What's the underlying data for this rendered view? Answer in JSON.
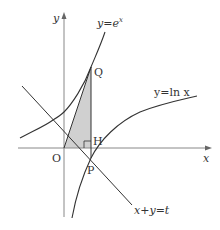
{
  "figure": {
    "colors": {
      "curve": "#333333",
      "axis": "#888888",
      "shade": "#d0d0d0",
      "background": "#ffffff"
    },
    "axes": {
      "x_label": "x",
      "y_label": "y"
    },
    "curves": {
      "exp_label": "y=e",
      "exp_superscript": "x",
      "ln_label": "y=ln x",
      "line_label": "x+y=t"
    },
    "points": {
      "origin": "O",
      "P": "P",
      "Q": "Q",
      "H": "H"
    }
  }
}
